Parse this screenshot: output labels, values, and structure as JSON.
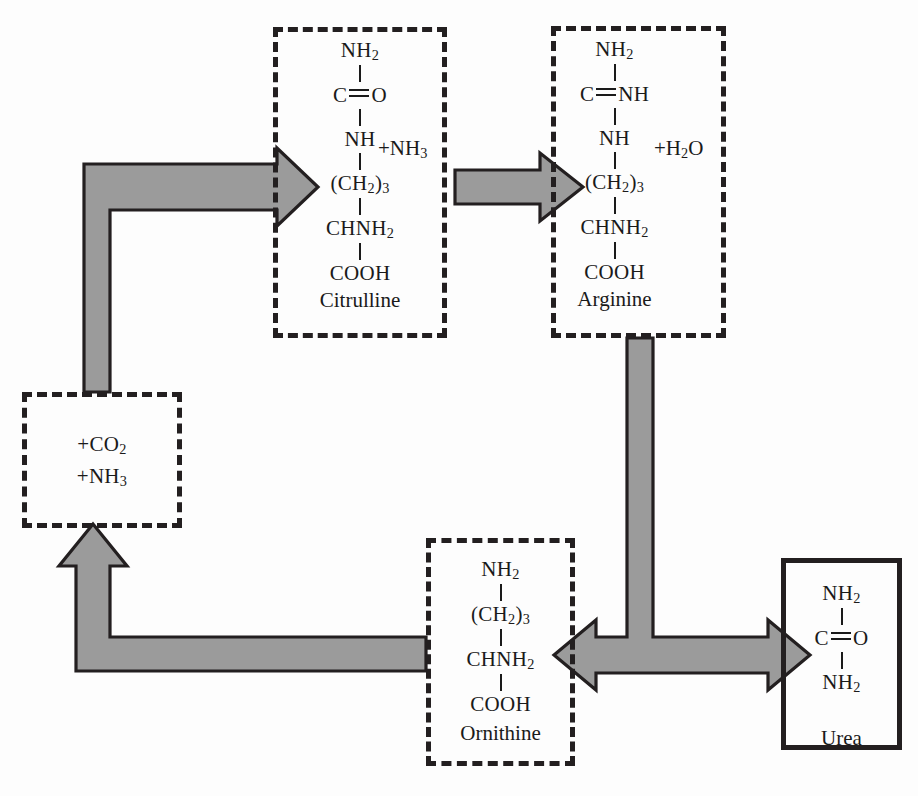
{
  "diagram": {
    "colors": {
      "ink": "#231f20",
      "arrow_fill": "#9b9b9b",
      "arrow_stroke": "#231f20",
      "background": "#ffffff"
    }
  },
  "nodes": {
    "citrulline": {
      "name": "Citrulline",
      "border": "dashed",
      "lines": [
        "NH2",
        "C=O",
        "NH",
        "(CH2)3",
        "CHNH2",
        "COOH"
      ],
      "structure": [
        {
          "type": "text",
          "value": "NH",
          "sub": "2"
        },
        {
          "type": "bond"
        },
        {
          "type": "double_bond",
          "left": "C",
          "right": "O"
        },
        {
          "type": "bond"
        },
        {
          "type": "text",
          "value": "NH",
          "sub": ""
        },
        {
          "type": "bond"
        },
        {
          "type": "text",
          "value": "(CH",
          "sub": "2",
          "tail": ")",
          "tail_sub": "3"
        },
        {
          "type": "bond"
        },
        {
          "type": "text",
          "value": "CHNH",
          "sub": "2"
        },
        {
          "type": "bond"
        },
        {
          "type": "text",
          "value": "COOH",
          "sub": ""
        }
      ],
      "addend": "+NH3",
      "addend_display": "+NH",
      "addend_sub": "3"
    },
    "arginine": {
      "name": "Arginine",
      "border": "dashed",
      "lines": [
        "NH2",
        "C=NH",
        "NH",
        "(CH2)3",
        "CHNH2",
        "COOH"
      ],
      "addend": "+H2O",
      "addend_display_a": "+H",
      "addend_sub": "2",
      "addend_display_b": "O"
    },
    "precursors": {
      "name": "",
      "border": "dashed",
      "line1_prefix": "+CO",
      "line1_sub": "2",
      "line2_prefix": "+NH",
      "line2_sub": "3",
      "lines": [
        "+CO2",
        "+NH3"
      ]
    },
    "ornithine": {
      "name": "Ornithine",
      "border": "dashed",
      "lines": [
        "NH2",
        "(CH2)3",
        "CHNH2",
        "COOH"
      ]
    },
    "urea": {
      "name": "Urea",
      "border": "solid",
      "lines": [
        "NH2",
        "C=O",
        "NH2"
      ]
    }
  },
  "atoms": {
    "NH": "NH",
    "C": "C",
    "O": "O",
    "CH_open": "(CH",
    "CH_close": ")",
    "CHNH": "CHNH",
    "COOH": "COOH",
    "sub2": "2",
    "sub3": "3"
  },
  "edges": [
    {
      "id": "precursors-to-citrulline",
      "from": "precursors",
      "to": "citrulline",
      "shape": "elbow-up-right",
      "heads": 1
    },
    {
      "id": "citrulline-to-arginine",
      "from": "citrulline",
      "to": "arginine",
      "shape": "straight-right",
      "heads": 1
    },
    {
      "id": "arginine-split",
      "from": "arginine",
      "to": "ornithine + urea",
      "shape": "tee-down-bidirectional",
      "heads": 2
    },
    {
      "id": "ornithine-to-precursors",
      "from": "ornithine",
      "to": "precursors",
      "shape": "elbow-left-up",
      "heads": 1
    }
  ]
}
